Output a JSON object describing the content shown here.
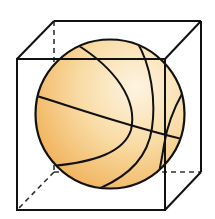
{
  "figure": {
    "colors": {
      "background": "#ffffff",
      "line": "#111111",
      "ball_light": "#fdf1d8",
      "ball_mid": "#f7cf8c",
      "ball_dark": "#eeaa4c"
    },
    "cube": {
      "front_top_left": [
        17,
        59
      ],
      "front_top_right": [
        165,
        59
      ],
      "front_bottom_right": [
        165,
        210
      ],
      "front_bottom_left": [
        17,
        210
      ],
      "back_top_left": [
        54,
        21
      ],
      "back_top_right": [
        201,
        21
      ],
      "back_bottom_right": [
        201,
        172
      ],
      "back_bottom_left": [
        54,
        172
      ]
    },
    "ball": {
      "cx": 110,
      "cy": 114,
      "r": 75
    }
  }
}
